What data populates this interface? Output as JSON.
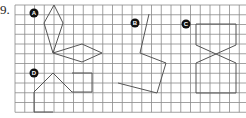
{
  "problem_number": "9.",
  "grid": {
    "x0": 15,
    "y0": 5,
    "cols": 24,
    "rows": 11,
    "cell": 9.75,
    "line_color": "#8a8a8a"
  },
  "shape_color": "#555555",
  "labels": [
    {
      "id": "A",
      "x": 34,
      "y": 13
    },
    {
      "id": "B",
      "x": 135,
      "y": 23
    },
    {
      "id": "C",
      "x": 186,
      "y": 24
    },
    {
      "id": "D",
      "x": 34,
      "y": 73
    }
  ],
  "shapes": {
    "A_vertical_kite": "54,5 44,23 53,53 63,23",
    "A_horizontal_kite": "53,53 82,44 102,53 82,62",
    "B_polyline": "149,14 140,53 166,63 157,93 118,83",
    "C_bowtie": "196,24 236,24 236,45 196,63 196,93 236,93 236,63 196,45",
    "D_polyline": "53,112 34,112 34,92 53,73 72,92 92,92 92,73 72,73"
  }
}
